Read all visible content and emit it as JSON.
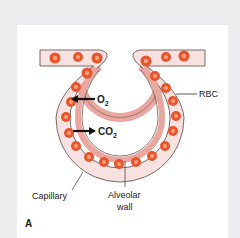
{
  "figure": {
    "panel_label": "A",
    "labels": {
      "rbc": "RBC",
      "o2_main": "O",
      "o2_sub": "2",
      "co2_main": "CO",
      "co2_sub": "2",
      "capillary": "Capillary",
      "alveolar_line1": "Alveolar",
      "alveolar_line2": "wall"
    },
    "colors": {
      "background": "#eeeef1",
      "panel": "#ffffff",
      "capillary_fill": "#f7e1e1",
      "capillary_outline": "#6b5a5a",
      "alveolar_wall": "#e9a7a0",
      "rbc_outer": "#e8552d",
      "rbc_inner": "#f7a27f",
      "arrow": "#111111"
    }
  }
}
